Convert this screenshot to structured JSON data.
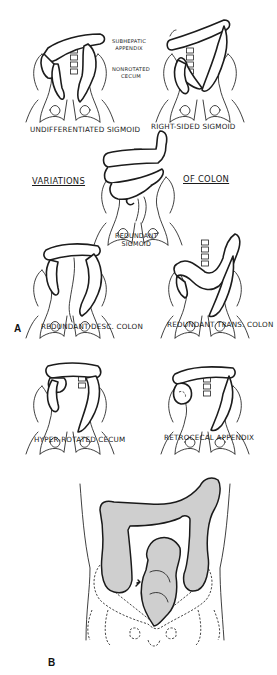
{
  "figure": {
    "panel_a": {
      "letter": "A",
      "title_left": "VARIATIONS",
      "title_right": "OF COLON",
      "annotations": {
        "subhepatic_appendix_line1": "SUBHEPATIC",
        "subhepatic_appendix_line2": "APPENDIX",
        "nonrotated_cecum_line1": "NONROTATED",
        "nonrotated_cecum_line2": "CECUM"
      },
      "variants": [
        {
          "label": "UNDIFFERENTIATED SIGMOID"
        },
        {
          "label": "RIGHT-SIDED SIGMOID"
        },
        {
          "label_line1": "REDUNDANT",
          "label_line2": "SIGMOID"
        },
        {
          "label": "REDUNDANT DESC. COLON"
        },
        {
          "label": "REDUNDANT TRANS. COLON"
        },
        {
          "label": "HYPER-ROTATED CECUM"
        },
        {
          "label": "RETROCECAL APPENDIX"
        }
      ]
    },
    "panel_b": {
      "letter": "B"
    },
    "colors": {
      "line": "#1c1c1c",
      "colon_fill_b": "#cfcfcf",
      "background": "#ffffff"
    }
  }
}
